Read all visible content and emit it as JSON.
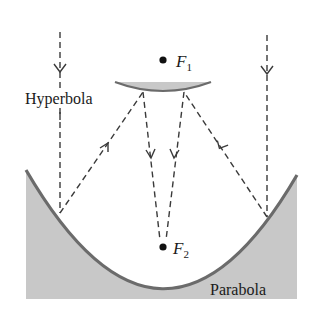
{
  "figure": {
    "labels": {
      "hyperbola": "Hyperbola",
      "parabola": "Parabola",
      "focus1_letter": "F",
      "focus1_sub": "1",
      "focus2_letter": "F",
      "focus2_sub": "2"
    },
    "colors": {
      "mirror_fill": "#c8c8c8",
      "mirror_stroke": "#6b6b6b",
      "ray": "#3a3a3a",
      "text": "#1a1a1a",
      "focus_dot": "#111111"
    },
    "rays": [
      {
        "id": "left-incoming",
        "direction": "down"
      },
      {
        "id": "right-incoming",
        "direction": "down"
      },
      {
        "id": "left-reflected-to-hyperbola",
        "direction": "up-right"
      },
      {
        "id": "right-reflected-to-hyperbola",
        "direction": "up-left"
      },
      {
        "id": "left-to-F2",
        "direction": "down"
      },
      {
        "id": "right-to-F2",
        "direction": "down"
      }
    ]
  }
}
